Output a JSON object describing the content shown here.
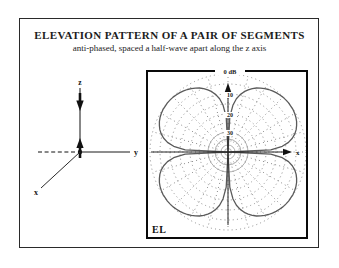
{
  "figure": {
    "title": "ELEVATION PATTERN OF A PAIR OF SEGMENTS",
    "subtitle": "anti-phased, spaced a half-wave apart along the z axis"
  },
  "axes_diagram": {
    "z_label": "z",
    "y_label": "y",
    "x_label": "x"
  },
  "polar_panel": {
    "corner_label": "EL",
    "top_scale_label": "0 dB",
    "ring_labels": [
      "10",
      "20",
      "30"
    ],
    "x_axis_label": "x",
    "colors": {
      "pattern": "#5a5a5a",
      "grid": "#8c8c8c",
      "axis": "#111111",
      "border": "#0a0a0a"
    }
  },
  "chart_data": {
    "type": "polar",
    "plane": "elevation (z vertical, x horizontal)",
    "angle_unit": "degrees from +z axis",
    "scale_db_floor": -40,
    "rings_db": [
      0,
      -10,
      -20,
      -30
    ],
    "outer_ring_db": 0,
    "nulls_deg": [
      0,
      90,
      180,
      270
    ],
    "lobe_peaks_deg": [
      51,
      129,
      231,
      309
    ],
    "symmetry": "mirror across z and x axes (four-lobe clover)",
    "quadrant_samples_deg_db": [
      [
        0,
        -40
      ],
      [
        3,
        -21.9
      ],
      [
        6,
        -15.9
      ],
      [
        9,
        -12.4
      ],
      [
        12,
        -9.9
      ],
      [
        15,
        -8.0
      ],
      [
        18,
        -6.5
      ],
      [
        21,
        -5.2
      ],
      [
        24,
        -4.1
      ],
      [
        27,
        -3.2
      ],
      [
        30,
        -2.5
      ],
      [
        33,
        -1.8
      ],
      [
        36,
        -1.3
      ],
      [
        39,
        -0.8
      ],
      [
        42,
        -0.5
      ],
      [
        45,
        -0.2
      ],
      [
        48,
        -0.1
      ],
      [
        51,
        0
      ],
      [
        54,
        -0.1
      ],
      [
        57,
        -0.2
      ],
      [
        60,
        -0.5
      ],
      [
        63,
        -0.9
      ],
      [
        66,
        -1.5
      ],
      [
        69,
        -2.3
      ],
      [
        72,
        -3.3
      ],
      [
        75,
        -4.6
      ],
      [
        78,
        -6.3
      ],
      [
        81,
        -8.6
      ],
      [
        84,
        -12.0
      ],
      [
        87,
        -18.0
      ],
      [
        90,
        -40
      ]
    ]
  }
}
